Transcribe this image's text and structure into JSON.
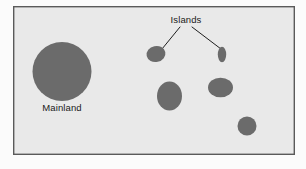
{
  "figure": {
    "canvas": {
      "width": 306,
      "height": 169
    },
    "colors": {
      "page_background": "#fbfbfb",
      "panel_background": "#e9e9e9",
      "panel_border": "#5a5a5a",
      "landmass_fill": "#6b6b6b",
      "leader_line": "#1f1f1f",
      "label_text": "#1a1a1a"
    },
    "panel": {
      "x": 13,
      "y": 6,
      "width": 282,
      "height": 149,
      "border_width": 1.4
    },
    "labels": [
      {
        "id": "islands",
        "text": "Islands",
        "x": 186,
        "y": 23,
        "anchor": "middle"
      },
      {
        "id": "mainland",
        "text": "Mainland",
        "x": 62,
        "y": 111,
        "anchor": "middle"
      }
    ],
    "leader_lines": [
      {
        "id": "leader-to-island-top-left",
        "x1": 180,
        "y1": 27,
        "x2": 162,
        "y2": 49
      },
      {
        "id": "leader-to-island-top-right",
        "x1": 192,
        "y1": 27,
        "x2": 221,
        "y2": 49
      }
    ],
    "landmasses": [
      {
        "id": "mainland",
        "name": "Mainland",
        "kind": "mainland",
        "cx": 62,
        "cy": 71.5,
        "rx": 29.5,
        "ry": 29.5,
        "rotate": 0
      },
      {
        "id": "island-top-left",
        "name": "Island (top left)",
        "kind": "island",
        "cx": 156,
        "cy": 54,
        "rx": 9.5,
        "ry": 8.0,
        "rotate": -12
      },
      {
        "id": "island-top-right",
        "name": "Island (top right)",
        "kind": "island",
        "cx": 222,
        "cy": 54.5,
        "rx": 4.2,
        "ry": 7.8,
        "rotate": 0
      },
      {
        "id": "island-middle-left",
        "name": "Island (middle left)",
        "kind": "island",
        "cx": 169.5,
        "cy": 96,
        "rx": 12.5,
        "ry": 14.5,
        "rotate": 0
      },
      {
        "id": "island-middle-right",
        "name": "Island (middle right)",
        "kind": "island",
        "cx": 220.5,
        "cy": 87.5,
        "rx": 12.5,
        "ry": 9.8,
        "rotate": 0
      },
      {
        "id": "island-bottom-right",
        "name": "Island (bottom right)",
        "kind": "island",
        "cx": 247,
        "cy": 126,
        "rx": 9.5,
        "ry": 9.5,
        "rotate": 0
      }
    ]
  }
}
